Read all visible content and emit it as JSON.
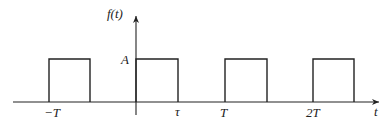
{
  "diagram": {
    "type": "periodic-rectangular-pulse-train",
    "function_label": "f(t)",
    "x_axis_label": "t",
    "amplitude_label": "A",
    "tick_labels": [
      "−T",
      "τ",
      "T",
      "2T"
    ],
    "colors": {
      "line": "#222222",
      "background": "#ffffff"
    },
    "pulses": [
      {
        "start": "−T",
        "end": "−T+τ"
      },
      {
        "start": "0",
        "end": "τ"
      },
      {
        "start": "T",
        "end": "T+τ"
      },
      {
        "start": "2T",
        "end": "2T+τ"
      }
    ]
  }
}
